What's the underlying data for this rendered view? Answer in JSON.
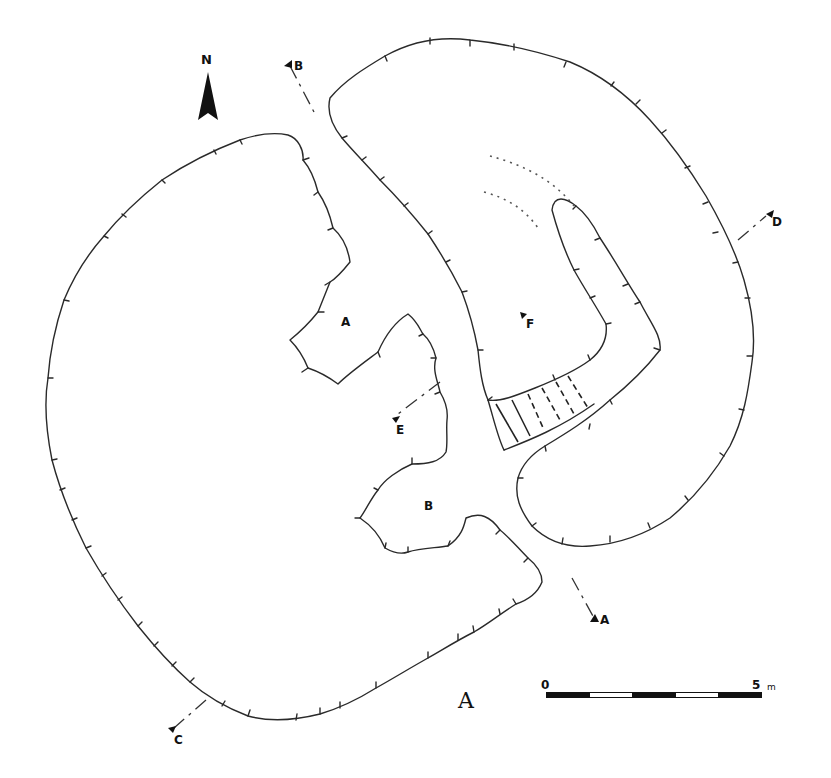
{
  "figure": {
    "label": "A"
  },
  "north_arrow": {
    "label": "N",
    "icon": "north-arrow-icon"
  },
  "area_labels": [
    {
      "id": "A",
      "text": "A"
    },
    {
      "id": "B",
      "text": "B"
    }
  ],
  "section_markers": [
    {
      "id": "A",
      "text": "A"
    },
    {
      "id": "B",
      "text": "B"
    },
    {
      "id": "C",
      "text": "C"
    },
    {
      "id": "D",
      "text": "D"
    },
    {
      "id": "E",
      "text": "E"
    },
    {
      "id": "F",
      "text": "F"
    }
  ],
  "scale_bar": {
    "start_label": "0",
    "end_label": "5",
    "unit": "m",
    "segments": 5
  },
  "colors": {
    "ink": "#2a2a2a",
    "background": "#ffffff"
  }
}
